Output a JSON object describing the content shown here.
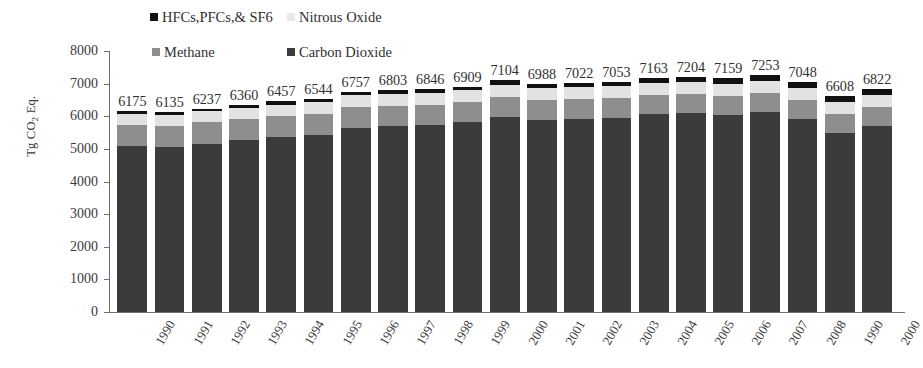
{
  "chart_data": {
    "type": "bar",
    "stacked": true,
    "title": "",
    "subtitle": "",
    "xlabel": "",
    "ylabel": "Tg CO2 Eq.",
    "ylabel_html": "Tg CO<sub>2</sub> Eq.",
    "ylim": [
      0,
      8000
    ],
    "ytick_labels": [
      "8000",
      "7000",
      "6000",
      "5000",
      "4000",
      "3000",
      "2000",
      "1000",
      "0"
    ],
    "ytick_values": [
      8000,
      7000,
      6000,
      5000,
      4000,
      3000,
      2000,
      1000,
      0
    ],
    "grid": false,
    "legend_position": "top",
    "categories": [
      "1990",
      "1991",
      "1992",
      "1993",
      "1994",
      "1995",
      "1996",
      "1997",
      "1998",
      "1999",
      "2000",
      "2001",
      "2002",
      "2003",
      "2004",
      "2005",
      "2006",
      "2007",
      "2008",
      "1990",
      "2000"
    ],
    "categories_full": [
      "1990",
      "1991",
      "1992",
      "1993",
      "1994",
      "1995",
      "1996",
      "1997",
      "1998",
      "1999",
      "2000",
      "2001",
      "2002",
      "2003",
      "2004",
      "2005",
      "2006",
      "2007",
      "2008",
      "1990",
      "2000",
      "2000"
    ],
    "totals": [
      6175,
      6135,
      6237,
      6360,
      6457,
      6544,
      6757,
      6803,
      6846,
      6909,
      7104,
      6988,
      7022,
      7053,
      7163,
      7204,
      7159,
      7253,
      7048,
      6608,
      6822
    ],
    "series": [
      {
        "name": "Carbon Dioxide",
        "color": "#3b3b3b",
        "values": [
          5080,
          5055,
          5155,
          5270,
          5355,
          5440,
          5645,
          5690,
          5735,
          5810,
          5990,
          5880,
          5920,
          5950,
          6060,
          6095,
          6040,
          6125,
          5920,
          5480,
          5690
        ]
      },
      {
        "name": "Methane",
        "color": "#8e8e8e",
        "values": [
          660,
          660,
          655,
          645,
          640,
          635,
          628,
          625,
          620,
          615,
          610,
          605,
          602,
          600,
          598,
          596,
          594,
          592,
          590,
          588,
          586
        ]
      },
      {
        "name": "Nitrous Oxide",
        "color": "#e2e2e2",
        "values": [
          340,
          330,
          337,
          345,
          352,
          359,
          364,
          366,
          367,
          368,
          370,
          368,
          366,
          368,
          370,
          372,
          370,
          370,
          365,
          360,
          362
        ]
      },
      {
        "name": "HFCs,PFCs,& SF6",
        "color": "#111111",
        "values": [
          95,
          90,
          90,
          100,
          110,
          110,
          120,
          122,
          124,
          116,
          134,
          135,
          134,
          135,
          135,
          141,
          155,
          166,
          173,
          180,
          184
        ]
      }
    ]
  },
  "legend": {
    "items": [
      {
        "label": "HFCs,PFCs,& SF6",
        "color": "#111111",
        "key": "hfc"
      },
      {
        "label": "Nitrous Oxide",
        "color": "#e2e2e2",
        "key": "n2o"
      },
      {
        "label": "Methane",
        "color": "#8e8e8e",
        "key": "ch4"
      },
      {
        "label": "Carbon Dioxide",
        "color": "#3b3b3b",
        "key": "co2"
      }
    ]
  },
  "axis": {
    "y_title": "Tg CO2 Eq."
  }
}
